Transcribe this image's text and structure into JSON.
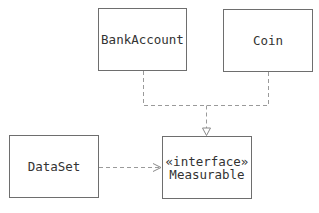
{
  "diagram": {
    "type": "UML class diagram",
    "colors": {
      "line": "#9a9a9a",
      "border": "#6e6e6e",
      "text": "#333333",
      "background": "#ffffff"
    },
    "classes": [
      {
        "id": "bankaccount",
        "name": "BankAccount",
        "stereotype": ""
      },
      {
        "id": "coin",
        "name": "Coin",
        "stereotype": ""
      },
      {
        "id": "dataset",
        "name": "DataSet",
        "stereotype": ""
      },
      {
        "id": "measurable",
        "name": "Measurable",
        "stereotype": "«interface»"
      }
    ],
    "relationships": [
      {
        "from": "BankAccount",
        "to": "Measurable",
        "kind": "realization",
        "line": "dashed",
        "arrowhead": "hollow-triangle"
      },
      {
        "from": "Coin",
        "to": "Measurable",
        "kind": "realization",
        "line": "dashed",
        "arrowhead": "hollow-triangle"
      },
      {
        "from": "DataSet",
        "to": "Measurable",
        "kind": "dependency",
        "line": "dashed",
        "arrowhead": "open"
      }
    ]
  }
}
